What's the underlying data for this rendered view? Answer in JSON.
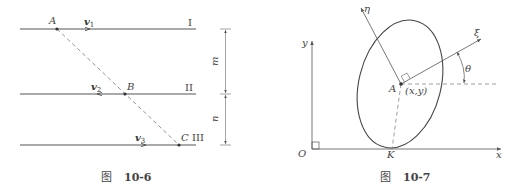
{
  "figures": [
    {
      "id": "fig-10-6",
      "caption_prefix": "图",
      "caption_number": "10-6",
      "lines": [
        {
          "roman": "I",
          "velocity": "v",
          "velocity_sub": "1"
        },
        {
          "roman": "II",
          "velocity": "v",
          "velocity_sub": "2"
        },
        {
          "roman": "III",
          "velocity": "v",
          "velocity_sub": "3"
        }
      ],
      "points": {
        "a": "A",
        "b": "B",
        "c": "C"
      },
      "dimensions": {
        "upper": "m",
        "lower": "n"
      }
    },
    {
      "id": "fig-10-7",
      "caption_prefix": "图",
      "caption_number": "10-7",
      "axes": {
        "x": "x",
        "y": "y",
        "origin": "O"
      },
      "body_axes": {
        "eta": "η",
        "xi": "ξ"
      },
      "angle": "θ",
      "center": {
        "label": "A",
        "coords": "(x,y)"
      },
      "contact_point": "K"
    }
  ],
  "colors": {
    "line": "#555555",
    "text": "#444444",
    "background": "#ffffff"
  }
}
